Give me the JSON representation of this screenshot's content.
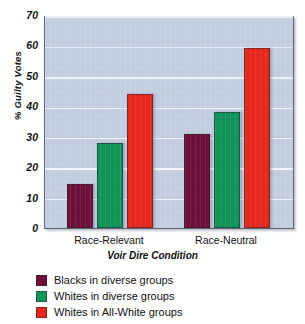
{
  "chart_data": {
    "type": "bar",
    "title": "",
    "xlabel": "Voir Dire Condition",
    "ylabel": "% Guilty Votes",
    "categories": [
      "Race-Relevant",
      "Race-Neutral"
    ],
    "series": [
      {
        "name": "Blacks in diverse groups",
        "color": "#6d1139",
        "values": [
          14.5,
          31
        ]
      },
      {
        "name": "Whites in diverse groups",
        "color": "#119459",
        "values": [
          28,
          38
        ]
      },
      {
        "name": "Whites in All-White groups",
        "color": "#e8271c",
        "values": [
          44,
          59
        ]
      }
    ],
    "ylim": [
      0,
      70
    ],
    "yticks": [
      0,
      10,
      20,
      30,
      40,
      50,
      60,
      70
    ],
    "ytick_labels": [
      "0",
      "10",
      "20",
      "30",
      "40",
      "50",
      "60",
      "70"
    ],
    "grid": true,
    "legend_position": "below",
    "plot_background": "#c3cee0",
    "gridline_color": "#f2f5fb",
    "frame_color": "#5d6577"
  }
}
